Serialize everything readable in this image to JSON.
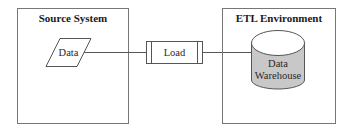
{
  "diagram": {
    "source_system": {
      "title": "Source System",
      "data_node": {
        "label": "Data",
        "shape": "parallelogram"
      }
    },
    "process": {
      "label": "Load",
      "shape": "predefined-process"
    },
    "etl_environment": {
      "title": "ETL Environment",
      "warehouse": {
        "label_line1": "Data",
        "label_line2": "Warehouse",
        "shape": "cylinder",
        "fill": "#c8c8c8"
      }
    },
    "colors": {
      "stroke": "#555555",
      "box_stroke": "#777777",
      "cylinder_body": "#c8c8c8",
      "cylinder_top": "#ffffff"
    }
  }
}
